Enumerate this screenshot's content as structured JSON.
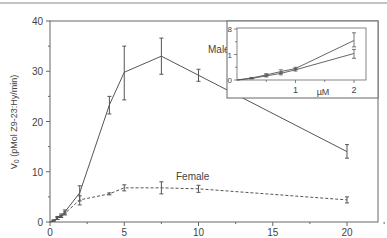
{
  "chart_data": [
    {
      "type": "line",
      "title": "",
      "xlabel": "",
      "ylabel": "V0 (pMol Z9-23:Hy/min)",
      "xlim": [
        0,
        22
      ],
      "ylim": [
        0,
        40
      ],
      "xticks": [
        0,
        5,
        10,
        15,
        20
      ],
      "yticks": [
        0,
        10,
        20,
        30,
        40
      ],
      "grid": false,
      "series": [
        {
          "name": "Male",
          "style": "solid",
          "x": [
            0,
            0.25,
            0.5,
            0.75,
            1,
            2,
            4,
            5,
            7.5,
            10,
            20
          ],
          "y": [
            0,
            0.3,
            0.8,
            1.3,
            2.0,
            5.8,
            23.3,
            29.8,
            33.0,
            29.2,
            14.0
          ],
          "err_low": [
            0,
            0.2,
            0.5,
            1.0,
            1.6,
            4.2,
            21.5,
            24.3,
            29.4,
            28.0,
            12.7
          ],
          "err_high": [
            0,
            0.4,
            1.1,
            1.6,
            2.4,
            7.2,
            25.0,
            35.0,
            36.6,
            30.4,
            15.4
          ]
        },
        {
          "name": "Female",
          "style": "dashed",
          "x": [
            0,
            0.25,
            0.5,
            0.75,
            1,
            2,
            4,
            5,
            7.5,
            10,
            20
          ],
          "y": [
            0,
            0.3,
            0.7,
            1.1,
            1.7,
            4.4,
            5.6,
            6.8,
            6.8,
            6.6,
            4.4
          ],
          "err_low": [
            0,
            0.2,
            0.5,
            0.9,
            1.4,
            3.4,
            5.4,
            6.2,
            5.6,
            5.9,
            3.8
          ],
          "err_high": [
            0,
            0.4,
            0.9,
            1.3,
            2.0,
            5.2,
            5.8,
            7.4,
            8.0,
            7.3,
            5.0
          ]
        }
      ],
      "annotations": [
        {
          "text": "Male",
          "x": 10.5,
          "y": 35.5
        },
        {
          "text": "Female",
          "x": 9.5,
          "y": 9.0
        }
      ]
    },
    {
      "type": "line",
      "title": "inset",
      "xlabel": "µM",
      "ylabel": "",
      "xlim": [
        0,
        2.2
      ],
      "ylim": [
        0,
        2
      ],
      "xticks": [
        1,
        2
      ],
      "ytick_labels": [
        "0",
        "1",
        "8"
      ],
      "series": [
        {
          "name": "upper",
          "x": [
            0,
            0.25,
            0.5,
            0.75,
            1,
            2
          ],
          "y": [
            0,
            0.08,
            0.2,
            0.33,
            0.45,
            1.55
          ],
          "err_low": [
            0,
            0.06,
            0.15,
            0.25,
            0.4,
            1.3
          ],
          "err_high": [
            0,
            0.1,
            0.25,
            0.4,
            0.5,
            1.85
          ]
        },
        {
          "name": "lower",
          "x": [
            0,
            0.25,
            0.5,
            0.75,
            1,
            2
          ],
          "y": [
            0,
            0.06,
            0.16,
            0.26,
            0.4,
            1.04
          ],
          "err_low": [
            0,
            0.04,
            0.12,
            0.2,
            0.35,
            0.85
          ],
          "err_high": [
            0,
            0.08,
            0.2,
            0.3,
            0.45,
            1.2
          ]
        }
      ]
    }
  ],
  "labels": {
    "y_axis": "V",
    "y_axis_sub": "0",
    "y_axis_rest": " (pMol Z9-23:Hy/min)",
    "male": "Male",
    "female": "Female",
    "inset_unit": "µM",
    "x_ticks": [
      "0",
      "5",
      "10",
      "15",
      "20"
    ],
    "y_ticks": [
      "0",
      "10",
      "20",
      "30",
      "40"
    ],
    "inset_x_ticks": [
      "1",
      "2"
    ],
    "inset_y_ticks": [
      "0",
      "1",
      "8"
    ]
  },
  "colors": {
    "line": "#555555",
    "axis": "#666666",
    "text": "#444444",
    "background": "#ffffff"
  }
}
